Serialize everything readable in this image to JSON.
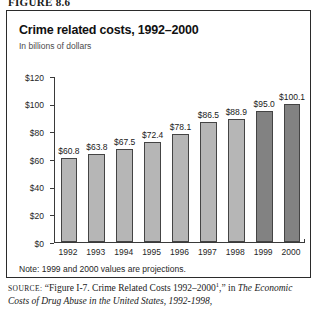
{
  "figure": {
    "number_label": "FIGURE 8.6"
  },
  "chart_data": {
    "type": "bar",
    "title": "Crime related costs, 1992–2000",
    "subtitle": "In billions of dollars",
    "xlabel": "",
    "ylabel": "In billions of dollars",
    "categories": [
      "1992",
      "1993",
      "1994",
      "1995",
      "1996",
      "1997",
      "1998",
      "1999",
      "2000"
    ],
    "values": [
      60.8,
      63.8,
      67.5,
      72.4,
      78.1,
      86.5,
      88.9,
      95.0,
      100.1
    ],
    "value_labels": [
      "$60.8",
      "$63.8",
      "$67.5",
      "$72.4",
      "$78.1",
      "$86.5",
      "$88.9",
      "$95.0",
      "$100.1"
    ],
    "projection_flags": [
      false,
      false,
      false,
      false,
      false,
      false,
      false,
      true,
      true
    ],
    "ylim": [
      0,
      120
    ],
    "ytick_values": [
      0,
      20,
      40,
      60,
      80,
      100,
      120
    ],
    "ytick_labels": [
      "$0",
      "$20",
      "$40",
      "$60",
      "$80",
      "$100",
      "$120"
    ],
    "grid": false,
    "legend": null,
    "note": "Note: 1999 and 2000 values are projections.",
    "colors": {
      "bar_fill": "#b6b6b6",
      "bar_projection_fill": "#828282",
      "bar_border": "#444444",
      "axis": "#3a3a3a",
      "text": "#1a1a1a",
      "frame": "#2b2b2b"
    }
  },
  "source": {
    "label": "source:",
    "line1_pre": "“Figure I-7. Crime Related Costs 1992–2000",
    "line1_sup": "1",
    "line1_post": ",” in ",
    "line1_italic": "The",
    "line2_italic": "Economic Costs of Drug Abuse in the United States, 1992-1998,"
  }
}
